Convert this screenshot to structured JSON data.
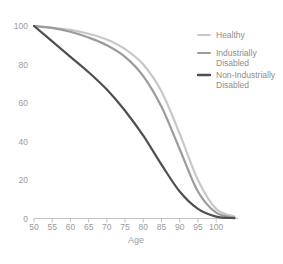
{
  "chart_data": {
    "type": "line",
    "title": "",
    "subtitle": "",
    "xlabel": "Age",
    "ylabel": "",
    "xlim": [
      50,
      106
    ],
    "ylim": [
      0,
      100
    ],
    "grid": false,
    "legend_position": "right",
    "xticks": [
      50,
      55,
      60,
      65,
      70,
      75,
      80,
      85,
      90,
      95,
      100
    ],
    "yticks": [
      0,
      20,
      40,
      60,
      80,
      100
    ],
    "xtick_labels": [
      "50",
      "55",
      "60",
      "65",
      "70",
      "75",
      "80",
      "85",
      "90",
      "95",
      "100"
    ],
    "ytick_labels": [
      "0",
      "20",
      "40",
      "60",
      "80",
      "100"
    ],
    "x": [
      50,
      55,
      60,
      65,
      70,
      75,
      80,
      85,
      90,
      95,
      100,
      105
    ],
    "series": [
      {
        "name": "Healthy",
        "color": "#c8c8c8",
        "width": 2.2,
        "values": [
          100,
          99,
          98,
          96,
          93,
          88,
          80,
          66,
          44,
          20,
          5,
          1
        ]
      },
      {
        "name": "Industrially Disabled",
        "color": "#9b9b9b",
        "width": 2.2,
        "values": [
          100,
          99,
          97,
          94,
          90,
          84,
          74,
          58,
          36,
          14,
          3,
          0.5
        ]
      },
      {
        "name": "Non-Industrially Disabled",
        "color": "#4f4f4f",
        "width": 2.2,
        "values": [
          100,
          92,
          84,
          76,
          67,
          56,
          43,
          28,
          14,
          5,
          1,
          0.2
        ]
      }
    ]
  },
  "legend": {
    "items": [
      {
        "label_line1": "Healthy",
        "label_line2": "",
        "color": "#c8c8c8"
      },
      {
        "label_line1": "Industrially",
        "label_line2": "Disabled",
        "color": "#9b9b9b"
      },
      {
        "label_line1": "Non-Industrially",
        "label_line2": "Disabled",
        "color": "#4f4f4f"
      }
    ]
  },
  "axes": {
    "x_title": "Age"
  }
}
